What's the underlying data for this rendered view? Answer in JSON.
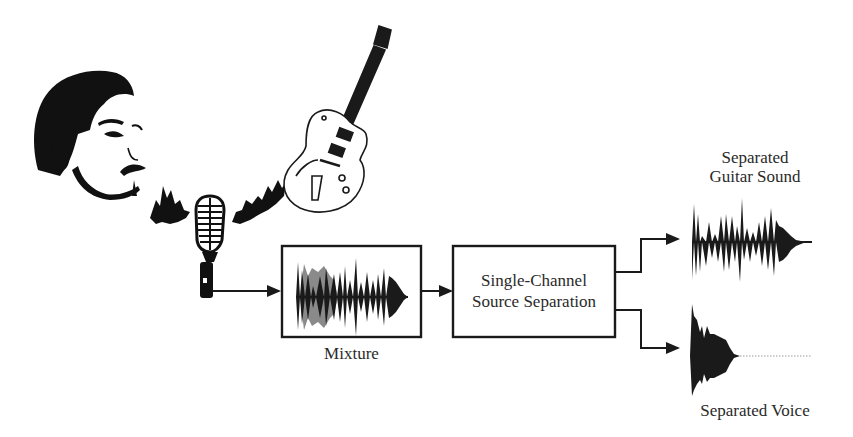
{
  "diagram": {
    "nodes": {
      "singer": {
        "label": "",
        "icon": "singer-face-illustration"
      },
      "guitar": {
        "label": "",
        "icon": "electric-guitar-illustration"
      },
      "microphone": {
        "label": "",
        "icon": "microphone-illustration"
      },
      "mixture": {
        "label": "Mixture",
        "icon": "mixture-waveform"
      },
      "separator": {
        "line1": "Single-Channel",
        "line2": "Source Separation"
      },
      "guitar_out": {
        "line1": "Separated",
        "line2": "Guitar Sound",
        "icon": "guitar-waveform"
      },
      "voice_out": {
        "label": "Separated Voice",
        "icon": "voice-waveform"
      }
    },
    "edges": [
      {
        "from": "microphone",
        "to": "mixture"
      },
      {
        "from": "mixture",
        "to": "separator"
      },
      {
        "from": "separator",
        "to": "guitar_out"
      },
      {
        "from": "separator",
        "to": "voice_out"
      }
    ],
    "colors": {
      "ink": "#1a1a1a",
      "secondary_wave": "#8a8a8a",
      "background": "#ffffff"
    }
  }
}
